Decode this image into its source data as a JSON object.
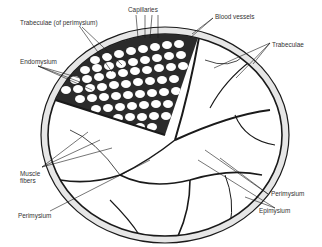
{
  "diagram": {
    "type": "anatomical cross-section",
    "labels": {
      "capillaries": "Capillaries",
      "blood_vessels": "Blood vessels",
      "trabeculae_perimysium": "Trabeculae (of perimysium)",
      "trabeculae": "Trabeculae",
      "endomysium": "Endomysium",
      "muscle_fibers_1": "Muscle",
      "muscle_fibers_2": "fibers",
      "perimysium_left": "Perimysium",
      "perimysium_right": "Perimysium",
      "epimysium": "Epimysium"
    },
    "colors": {
      "ink": "#1a1a1a",
      "sheath": "#d8d8d8",
      "background": "#ffffff"
    }
  }
}
